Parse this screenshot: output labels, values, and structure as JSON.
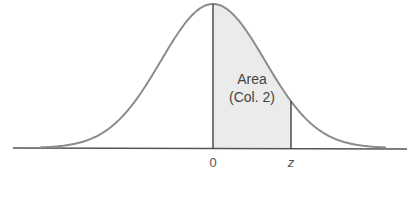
{
  "chart_data": {
    "type": "area",
    "title": "",
    "xlabel": "",
    "ylabel": "",
    "tick_labels": [
      "0",
      "z"
    ],
    "annotation": {
      "line1": "Area",
      "line2": "(Col. 2)"
    },
    "shaded_region": {
      "from": "0",
      "to": "z"
    },
    "grid": false,
    "legend": null,
    "colors": {
      "curve": "#8c8c8c",
      "axis": "#555555",
      "lines": "#333333",
      "fill": "#ebebeb"
    }
  }
}
